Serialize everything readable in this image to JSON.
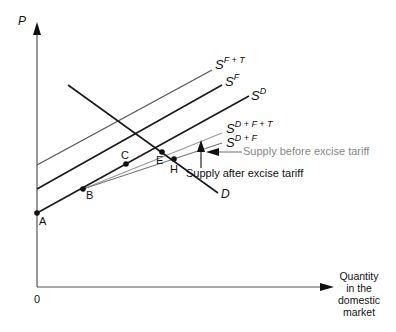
{
  "diagram": {
    "axes": {
      "y_label": "P",
      "x_label_lines": [
        "Quantity",
        "in the",
        "domestic",
        "market"
      ],
      "origin_label": "0"
    },
    "curves": {
      "sft": {
        "base": "S",
        "sup": "F + T"
      },
      "sf": {
        "base": "S",
        "sup": "F"
      },
      "sd": {
        "base": "S",
        "sup": "D"
      },
      "sdft": {
        "base": "S",
        "sup": "D + F + T"
      },
      "sdf": {
        "base": "S",
        "sup": "D + F"
      },
      "demand": "D"
    },
    "points": {
      "a": "A",
      "b": "B",
      "c": "C",
      "e": "E",
      "h": "H"
    },
    "annotations": {
      "before": "Supply before excise tariff",
      "after": "Supply after excise tariff"
    },
    "colors": {
      "dark_line": "#1a1a1a",
      "grey_line": "#555555",
      "light_line": "#999999",
      "before_text": "#888888"
    }
  }
}
